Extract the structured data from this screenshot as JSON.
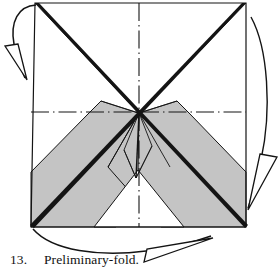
{
  "figure": {
    "kind": "origami-instruction-diagram",
    "background_color": "#ffffff",
    "ink_color": "#141414",
    "paper_shaded_color": "#c4c4c4",
    "paper_white_color": "#ffffff",
    "canvas": {
      "width": 279,
      "height": 271
    }
  },
  "caption": {
    "number": "13.",
    "text": "Preliminary-fold."
  },
  "sheet": {
    "label": "square-sheet",
    "corners": {
      "top_left": [
        35,
        3
      ],
      "top_right": [
        246,
        3
      ],
      "bottom_right": [
        246,
        227
      ],
      "bottom_left": [
        31,
        227
      ]
    },
    "outline_color": "#141414",
    "outline_width": 1.2
  },
  "creases": [
    {
      "name": "diagonal-tl-br",
      "from": [
        35,
        3
      ],
      "to": [
        246,
        227
      ],
      "style": "valley-heavy"
    },
    {
      "name": "diagonal-tr-bl",
      "from": [
        246,
        3
      ],
      "to": [
        31,
        227
      ],
      "style": "valley-heavy"
    },
    {
      "name": "center-vertical",
      "from": [
        139,
        3
      ],
      "to": [
        139,
        227
      ],
      "style": "dash-dot"
    },
    {
      "name": "center-horizontal",
      "from": [
        31,
        112
      ],
      "to": [
        246,
        112
      ],
      "style": "dash-dot"
    }
  ],
  "flaps": [
    {
      "name": "left-shaded-flap",
      "fill": "#c4c4c4",
      "points": "101,101 88,114 31,172 31,227 116,227 170,167 138,113"
    },
    {
      "name": "right-shaded-flap",
      "fill": "#c4c4c4",
      "points": "177,101 190,114 246,172 246,227 161,227 108,167 139,113"
    },
    {
      "name": "bottom-white-wedge",
      "fill": "#ffffff",
      "points": "138,170 94,227 184,227"
    }
  ],
  "center_detail": {
    "name": "center-diamond",
    "apex_top": [
      139,
      113
    ],
    "apex_bottom": [
      136,
      178
    ],
    "left": [
      124,
      150
    ],
    "right": [
      152,
      146
    ]
  },
  "arrows": [
    {
      "name": "fold-arrow-left",
      "description": "curved arrow from top-left corner sweeping left and down",
      "path": "M 36,5 C 18,6 10,22 14,44 C 17,62 22,70 25,78",
      "head": "18,46 6,47 26,79"
    },
    {
      "name": "fold-arrow-right",
      "description": "long curved arrow down the right side",
      "path": "M 251,17 C 268,48 272,110 261,160 C 256,186 251,198 248,208",
      "head": "261,155 276,156 249,210"
    },
    {
      "name": "fold-arrow-bottom",
      "description": "curved arrow along the bottom sweeping right",
      "path": "M 33,229 C 52,250 100,256 146,250 C 178,246 196,240 209,236",
      "head": "147,252 144,262 212,238"
    }
  ]
}
